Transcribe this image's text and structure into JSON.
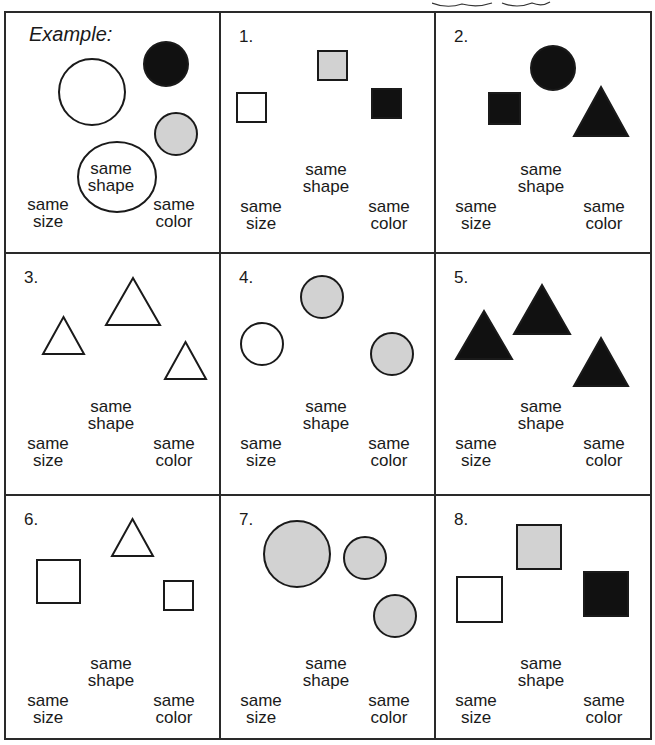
{
  "colors": {
    "black": "#111111",
    "gray": "#d2d2d2",
    "white": "#ffffff",
    "stroke": "#1a1a1a"
  },
  "labels": {
    "size_1": "same",
    "size_2": "size",
    "shape_1": "same",
    "shape_2": "shape",
    "color_1": "same",
    "color_2": "color"
  },
  "cells": [
    {
      "label": "Example:",
      "shapes": [
        {
          "type": "circle",
          "fill": "white",
          "cx": 86,
          "cy": 79,
          "r": 33
        },
        {
          "type": "circle",
          "fill": "black",
          "cx": 160,
          "cy": 51,
          "r": 22
        },
        {
          "type": "circle",
          "fill": "gray",
          "cx": 170,
          "cy": 121,
          "r": 21
        },
        {
          "type": "ellipse",
          "fill": "white",
          "cx": 111,
          "cy": 164,
          "rx": 39,
          "ry": 35
        }
      ]
    },
    {
      "label": "1.",
      "shapes": [
        {
          "type": "square",
          "fill": "gray",
          "x": 97,
          "y": 38,
          "s": 29
        },
        {
          "type": "square",
          "fill": "white",
          "x": 16,
          "y": 80,
          "s": 29
        },
        {
          "type": "square",
          "fill": "black",
          "x": 151,
          "y": 76,
          "s": 29
        }
      ]
    },
    {
      "label": "2.",
      "shapes": [
        {
          "type": "circle",
          "fill": "black",
          "cx": 117,
          "cy": 55,
          "r": 22
        },
        {
          "type": "square",
          "fill": "black",
          "x": 53,
          "y": 80,
          "s": 31
        },
        {
          "type": "triangle",
          "fill": "black",
          "x": 138,
          "y": 74,
          "w": 54,
          "h": 49
        }
      ]
    },
    {
      "label": "3.",
      "shapes": [
        {
          "type": "triangle",
          "fill": "white",
          "x": 37,
          "y": 63,
          "w": 41,
          "h": 37
        },
        {
          "type": "triangle",
          "fill": "white",
          "x": 100,
          "y": 24,
          "w": 54,
          "h": 47
        },
        {
          "type": "triangle",
          "fill": "white",
          "x": 159,
          "y": 88,
          "w": 41,
          "h": 37
        }
      ]
    },
    {
      "label": "4.",
      "shapes": [
        {
          "type": "circle",
          "fill": "gray",
          "cx": 101,
          "cy": 43,
          "r": 21
        },
        {
          "type": "circle",
          "fill": "white",
          "cx": 41,
          "cy": 90,
          "r": 21
        },
        {
          "type": "circle",
          "fill": "gray",
          "cx": 171,
          "cy": 100,
          "r": 21
        }
      ]
    },
    {
      "label": "5.",
      "shapes": [
        {
          "type": "triangle",
          "fill": "black",
          "x": 20,
          "y": 57,
          "w": 56,
          "h": 48
        },
        {
          "type": "triangle",
          "fill": "black",
          "x": 78,
          "y": 31,
          "w": 56,
          "h": 49
        },
        {
          "type": "triangle",
          "fill": "black",
          "x": 138,
          "y": 84,
          "w": 54,
          "h": 48
        }
      ]
    },
    {
      "label": "6.",
      "shapes": [
        {
          "type": "triangle",
          "fill": "white",
          "x": 106,
          "y": 23,
          "w": 41,
          "h": 37
        },
        {
          "type": "square",
          "fill": "white",
          "x": 31,
          "y": 64,
          "s": 43
        },
        {
          "type": "square",
          "fill": "white",
          "x": 158,
          "y": 85,
          "s": 29
        }
      ]
    },
    {
      "label": "7.",
      "shapes": [
        {
          "type": "circle",
          "fill": "gray",
          "cx": 76,
          "cy": 58,
          "r": 33
        },
        {
          "type": "circle",
          "fill": "gray",
          "cx": 144,
          "cy": 62,
          "r": 21
        },
        {
          "type": "circle",
          "fill": "gray",
          "cx": 174,
          "cy": 120,
          "r": 21
        }
      ]
    },
    {
      "label": "8.",
      "shapes": [
        {
          "type": "square",
          "fill": "gray",
          "x": 81,
          "y": 29,
          "s": 44
        },
        {
          "type": "square",
          "fill": "white",
          "x": 21,
          "y": 81,
          "s": 45
        },
        {
          "type": "square",
          "fill": "black",
          "x": 148,
          "y": 76,
          "s": 44
        }
      ]
    }
  ]
}
